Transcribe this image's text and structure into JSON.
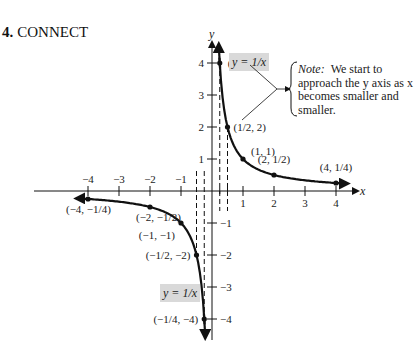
{
  "heading": {
    "number": "4.",
    "title": "CONNECT"
  },
  "note": {
    "label": "Note:",
    "text": "We start to approach the y axis as x becomes smaller and smaller."
  },
  "chart_data": {
    "type": "line",
    "title": "CONNECT",
    "function": "y = 1/x",
    "xlabel": "x",
    "ylabel": "y",
    "xlim": [
      -4.5,
      4.8
    ],
    "ylim": [
      -4.5,
      4.6
    ],
    "grid": false,
    "x_ticks": [
      -4,
      -3,
      -2,
      -1,
      1,
      2,
      3,
      4
    ],
    "y_ticks": [
      4,
      3,
      2,
      1,
      -1,
      -2,
      -3,
      -4
    ],
    "x_tick_labels": [
      "−4",
      "−3",
      "−2",
      "−1",
      "1",
      "2",
      "3",
      "4"
    ],
    "y_tick_labels": [
      "4",
      "3",
      "2",
      "1",
      "−1",
      "−2",
      "−3",
      "−4"
    ],
    "series": [
      {
        "name": "y = 1/x (x > 0)",
        "points": [
          {
            "x": 0.25,
            "y": 4,
            "label": "(1/4, 4)"
          },
          {
            "x": 0.5,
            "y": 2,
            "label": "(1/2, 2)"
          },
          {
            "x": 1,
            "y": 1,
            "label": "(1, 1)"
          },
          {
            "x": 2,
            "y": 0.5,
            "label": "(2, 1/2)"
          },
          {
            "x": 4,
            "y": 0.25,
            "label": "(4, 1/4)"
          }
        ]
      },
      {
        "name": "y = 1/x (x < 0)",
        "points": [
          {
            "x": -4,
            "y": -0.25,
            "label": "(−4, −1/4)"
          },
          {
            "x": -2,
            "y": -0.5,
            "label": "(−2, −1/2)"
          },
          {
            "x": -1,
            "y": -1,
            "label": "(−1, −1)"
          },
          {
            "x": -0.5,
            "y": -2,
            "label": "(−1/2, −2)"
          },
          {
            "x": -0.25,
            "y": -4,
            "label": "(−1/4, −4)"
          }
        ]
      }
    ],
    "annotations": [
      {
        "text": "y = 1/x",
        "position": "upper branch, boxed, gray background"
      },
      {
        "text": "y = 1/x",
        "position": "lower branch, boxed, gray background"
      },
      {
        "text": "Note: We start to approach the y axis as x becomes smaller and smaller.",
        "position": "right, with arrow from points (1/4,4) and (1/2,2)"
      }
    ],
    "guide_lines": "dashed vertical lines at x = ±1/4 and x = ±1/2"
  }
}
